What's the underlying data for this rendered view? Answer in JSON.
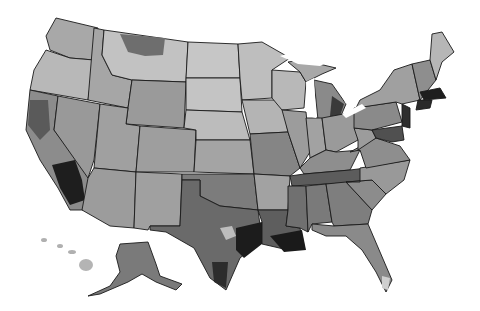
{
  "map": {
    "type": "choropleth",
    "subject": "United States",
    "color_scheme": "grayscale",
    "scale_colors": [
      "#d2d2d2",
      "#b4b4b4",
      "#999999",
      "#7e7e7e",
      "#606060",
      "#3e3e3e",
      "#1c1c1c"
    ],
    "background": "#ffffff",
    "insets": [
      "Alaska",
      "Hawaii"
    ],
    "darkest_regions": [
      "Southern California",
      "Southeast Texas",
      "Southern Louisiana",
      "Massachusetts",
      "New Jersey",
      "Eastern Michigan"
    ],
    "lightest_regions": [
      "Northern Plains",
      "Montana",
      "Maine (north)",
      "South Florida tip"
    ]
  }
}
